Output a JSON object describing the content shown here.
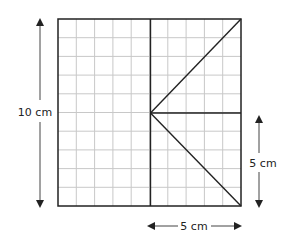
{
  "diagram": {
    "type": "geometry-grid",
    "grid": {
      "columns": 10,
      "rows": 10,
      "x": 58,
      "y": 19,
      "width": 183,
      "height": 187,
      "grid_color": "#c8c8c8",
      "outline_color": "#222222"
    },
    "lines": [
      {
        "name": "center-vertical-line",
        "from": [
          150.5,
          19
        ],
        "to": [
          150.5,
          206
        ]
      },
      {
        "name": "mid-horizontal-line",
        "from": [
          150.5,
          113
        ],
        "to": [
          241,
          113
        ]
      },
      {
        "name": "upper-diagonal-line",
        "from": [
          150.5,
          113
        ],
        "to": [
          241,
          19
        ]
      },
      {
        "name": "lower-diagonal-line",
        "from": [
          150.5,
          113
        ],
        "to": [
          241,
          206
        ]
      }
    ],
    "dimensions": {
      "left": {
        "label": "10 cm",
        "arrow_x": 40,
        "y_top": 19,
        "y_bottom": 206,
        "label_x": 35,
        "label_y": 115
      },
      "right": {
        "label": "5 cm",
        "arrow_x": 259,
        "y_top": 115,
        "y_bottom": 207,
        "label_x": 262,
        "label_y": 166
      },
      "bottom": {
        "label": "5 cm",
        "arrow_y": 226,
        "x_left": 148,
        "x_right": 240,
        "label_x": 194,
        "label_y": 230
      }
    }
  }
}
